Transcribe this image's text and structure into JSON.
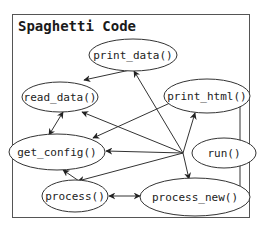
{
  "diagram": {
    "title": "Spaghetti Code",
    "frame": {
      "x": 12,
      "y": 14,
      "w": 238,
      "h": 204
    },
    "nodes": [
      {
        "id": "print_data",
        "label": "print_data()",
        "cx": 133,
        "cy": 55,
        "rx": 44,
        "ry": 16
      },
      {
        "id": "read_data",
        "label": "read_data()",
        "cx": 60,
        "cy": 97,
        "rx": 38,
        "ry": 15
      },
      {
        "id": "print_html",
        "label": "print_html()",
        "cx": 207,
        "cy": 96,
        "rx": 43,
        "ry": 17
      },
      {
        "id": "get_config",
        "label": "get_config()",
        "cx": 57,
        "cy": 152,
        "rx": 48,
        "ry": 18
      },
      {
        "id": "run",
        "label": "run()",
        "cx": 224,
        "cy": 153,
        "rx": 32,
        "ry": 15
      },
      {
        "id": "process",
        "label": "process()",
        "cx": 75,
        "cy": 196,
        "rx": 33,
        "ry": 16
      },
      {
        "id": "process_new",
        "label": "process_new()",
        "cx": 195,
        "cy": 197,
        "rx": 55,
        "ry": 19
      }
    ],
    "edges": [
      {
        "from": "print_data",
        "to": "read_data",
        "points": [
          [
            130,
            70
          ],
          [
            84,
            80
          ]
        ],
        "bidirectional": false
      },
      {
        "from": "run",
        "to": "print_data",
        "points": [
          [
            183,
            153
          ],
          [
            134,
            71
          ]
        ],
        "bidirectional": false
      },
      {
        "from": "run",
        "to": "read_data",
        "points": [
          [
            183,
            153
          ],
          [
            82,
            112
          ]
        ],
        "bidirectional": false
      },
      {
        "from": "run",
        "to": "get_config",
        "points": [
          [
            183,
            153
          ],
          [
            106,
            151
          ]
        ],
        "bidirectional": false
      },
      {
        "from": "run",
        "to": "process",
        "points": [
          [
            183,
            153
          ],
          [
            78,
            181
          ]
        ],
        "bidirectional": false
      },
      {
        "from": "run",
        "to": "print_html",
        "points": [
          [
            183,
            153
          ],
          [
            195,
            113
          ]
        ],
        "bidirectional": false
      },
      {
        "from": "run",
        "to": "process_new",
        "points": [
          [
            183,
            153
          ],
          [
            189,
            179
          ]
        ],
        "bidirectional": false
      },
      {
        "from": "print_html",
        "to": "get_config",
        "points": [
          [
            170,
            103
          ],
          [
            93,
            138
          ]
        ],
        "bidirectional": false
      },
      {
        "from": "read_data",
        "to": "get_config",
        "points": [
          [
            63,
            112
          ],
          [
            49,
            135
          ]
        ],
        "bidirectional": true
      },
      {
        "from": "process",
        "to": "get_config",
        "points": [
          [
            79,
            181
          ],
          [
            63,
            170
          ]
        ],
        "bidirectional": false
      },
      {
        "from": "process",
        "to": "process_new",
        "points": [
          [
            109,
            196
          ],
          [
            140,
            196
          ]
        ],
        "bidirectional": true
      },
      {
        "from": "process_new",
        "to": "print_html",
        "points": [
          [
            249,
            197
          ],
          [
            240,
            197
          ],
          [
            240,
            97
          ]
        ],
        "bidirectional": false,
        "orthogonal": true
      }
    ]
  }
}
